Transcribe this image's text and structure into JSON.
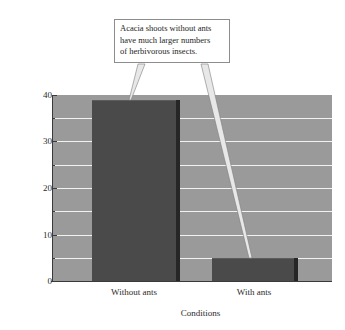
{
  "chart_data": {
    "type": "bar",
    "title": "",
    "categories": [
      "Without ants",
      "With ants"
    ],
    "values": [
      39,
      5
    ],
    "xlabel": "Conditions",
    "ylabel": "Shoots with herbivorous insects (%)",
    "ylim": [
      0,
      40
    ],
    "ytick_major": [
      0,
      10,
      20,
      30,
      40
    ],
    "ytick_minor": [
      5,
      15,
      25,
      35
    ],
    "ytick_labels": [
      "0",
      "10",
      "20",
      "30",
      "40"
    ],
    "grid": true,
    "legend": "none",
    "bar_color": "#4a4a4a",
    "plot_background": "#9a9a9a",
    "gridline_color": "#f2f2f2",
    "annotations": [
      {
        "text_lines": [
          "Acacia shoots without ants",
          "have much larger numbers",
          "of herbivorous insects."
        ],
        "points_to": [
          "Without ants",
          "With ants"
        ]
      }
    ]
  },
  "callout": {
    "line1": "Acacia shoots without ants",
    "line2": "have much larger numbers",
    "line3": "of herbivorous insects."
  },
  "axes": {
    "ylabel": "Shoots with herbivorous insects (%)",
    "xlabel": "Conditions",
    "ytick_0": "0",
    "ytick_1": "10",
    "ytick_2": "20",
    "ytick_3": "30",
    "ytick_4": "40",
    "xtick_0": "Without ants",
    "xtick_1": "With ants"
  }
}
